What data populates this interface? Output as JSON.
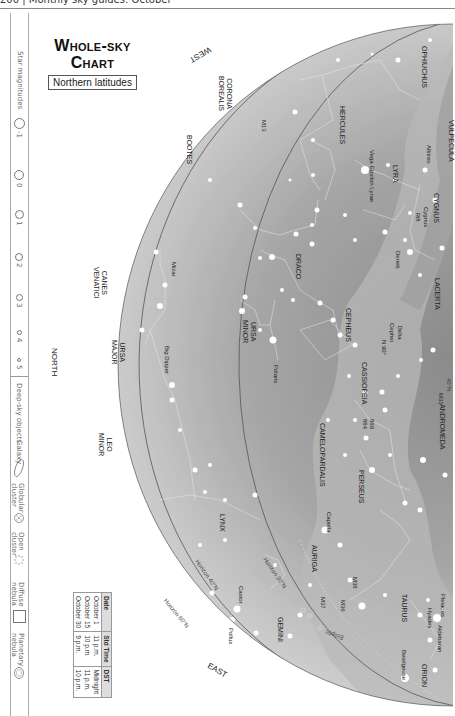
{
  "header": {
    "page_number": "200",
    "separator": "|",
    "running_title": "Monthly sky guides: October"
  },
  "title": {
    "line1": "Whole-sky",
    "line2": "Chart",
    "subtitle": "Northern latitudes"
  },
  "legend": {
    "star_magnitudes_label": "Star magnitudes",
    "magnitudes": [
      "-1",
      "0",
      "1",
      "2",
      "3",
      "4",
      "5"
    ],
    "deep_sky_label": "Deep-sky objects",
    "deep_sky": [
      {
        "label": "Galaxy",
        "icon": "galaxy-ellipse-icon"
      },
      {
        "label": "Globular\ncluster",
        "icon": "globular-cluster-icon"
      },
      {
        "label": "Open\ncluster",
        "icon": "open-cluster-icon"
      },
      {
        "label": "Diffuse\nnebula",
        "icon": "diffuse-nebula-square-icon"
      },
      {
        "label": "Planetary\nnebula",
        "icon": "planetary-nebula-icon"
      }
    ]
  },
  "time_table": {
    "headers": [
      "Date",
      "Std Time",
      "DST"
    ],
    "rows": [
      [
        "October 1",
        "11 p.m.",
        "Midnight"
      ],
      [
        "October 15",
        "10 p.m.",
        "11 p.m."
      ],
      [
        "October 30",
        "9 p.m.",
        "10 p.m."
      ]
    ]
  },
  "directions": {
    "west": "WEST",
    "north": "NORTH",
    "east": "EAST"
  },
  "horizons": {
    "h60": "Horizon 60°N",
    "h40": "Horizon 40°N",
    "h20": "Horizon 20°N",
    "lat40": "40°N",
    "ecliptic": "Ecliptic"
  },
  "constellations": {
    "corona_borealis": "CORONA\nBOREALIS",
    "bootes": "BOOTES",
    "hercules": "HERCULES",
    "ophiuchus": "OPHIUCHUS",
    "vulpecula": "VULPECULA",
    "lyra": "LYRA",
    "cygnus": "CYGNUS",
    "lacerta": "LACERTA",
    "draco": "DRACO",
    "cepheus": "CEPHEUS",
    "canes_venatici": "CANES\nVENATICI",
    "ursa_minor": "URSA\nMINOR",
    "ursa_major": "URSA\nMAJOR",
    "cassiopeia": "CASSIOPEIA",
    "andromeda": "ANDROMEDA",
    "camelopardalis": "CAMELOPARDALIS",
    "perseus": "PERSEUS",
    "leo_minor": "LEO\nMINOR",
    "lynx": "LYNX",
    "auriga": "AURIGA",
    "taurus": "TAURUS",
    "gemini": "GEMINI",
    "orion": "ORION"
  },
  "stars_objects": {
    "m13": "M13",
    "vega": "Vega",
    "epsilon_lyrae": "Epsilon Lyrae",
    "albireo": "Albireo",
    "cygnus_rift": "Cygnus\nRift",
    "deneb": "Deneb",
    "mizar": "Mizar",
    "big_dipper": "Big Dipper",
    "polaris": "Polaris",
    "delta_cephei": "Delta\nCephei",
    "n90": "N 90°",
    "m31": "M31",
    "ngc869": "869",
    "ngc884": "884",
    "capella": "Capella",
    "m38": "M38",
    "m36": "M36",
    "m37": "M37",
    "pleiades": "Pleiades",
    "hyades": "Hyades",
    "aldebaran": "Aldebaran",
    "betelgeuse": "Betelgeuse",
    "castor": "Castor",
    "pollux": "Pollux"
  },
  "colors": {
    "sky_light": "#e6e6e6",
    "sky_mid": "#b5b5b5",
    "sky_dark": "#8e8e8e",
    "milky_way": "#a8a8a8",
    "horizon_line": "#555555",
    "star": "#ffffff"
  }
}
